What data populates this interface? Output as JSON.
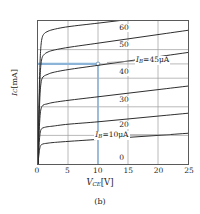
{
  "figure": {
    "caption": "(b)"
  },
  "axes": {
    "xlabel_main": "V",
    "xlabel_sub": "CE",
    "xlabel_unit": "[V]",
    "ylabel_main": "I",
    "ylabel_sub": "C",
    "ylabel_unit": "[mA]",
    "xticks": [
      "0",
      "5",
      "10",
      "15",
      "20",
      "25"
    ],
    "yticks": [
      "0",
      "2",
      "4",
      "6",
      "7",
      "8",
      "10"
    ]
  },
  "annotations": {
    "ib45_main": "I",
    "ib45_sub": "B",
    "ib45_rest": "=45μA",
    "ib10_main": "I",
    "ib10_sub": "B",
    "ib10_rest": "=10μA",
    "marker_x": "10",
    "marker_y": "7"
  },
  "colors": {
    "curve": "#2b2b2b",
    "grid": "#9a9a9a",
    "frame": "#5a5a5a",
    "annotation_blue": "#8cb4d8",
    "background": "#ffffff"
  },
  "curve_labels": [
    {
      "text": "60"
    },
    {
      "text": "50"
    },
    {
      "text": "40"
    },
    {
      "text": "30"
    },
    {
      "text": "20"
    },
    {
      "text": "0"
    }
  ],
  "chart_data": {
    "type": "line",
    "title": "",
    "subtitle": "",
    "caption": "(b)",
    "xlabel": "V_CE[V]",
    "ylabel": "I_C[mA]",
    "xlim": [
      0,
      25
    ],
    "ylim": [
      0,
      10
    ],
    "xticks": [
      0,
      5,
      10,
      15,
      20,
      25
    ],
    "yticks": [
      0,
      2,
      4,
      6,
      7,
      8,
      10
    ],
    "grid": true,
    "legend": "inline-curve-labels",
    "series": [
      {
        "name": "60",
        "ib_uA": 60,
        "label": "60",
        "label_at": {
          "x": 14.2,
          "y": 9.55
        },
        "x": [
          0,
          0.1,
          0.2,
          0.35,
          0.5,
          0.7,
          1.0,
          1.5,
          2.5,
          5,
          10,
          15,
          20,
          25
        ],
        "y": [
          0,
          2.6,
          5.0,
          7.2,
          8.3,
          8.85,
          9.1,
          9.25,
          9.4,
          9.6,
          9.85,
          10.1,
          10.35,
          10.6
        ]
      },
      {
        "name": "50",
        "ib_uA": 50,
        "label": "50",
        "label_at": {
          "x": 14.2,
          "y": 8.35
        },
        "x": [
          0,
          0.1,
          0.2,
          0.35,
          0.5,
          0.7,
          1.0,
          1.5,
          2.5,
          5,
          10,
          15,
          20,
          25
        ],
        "y": [
          0,
          2.2,
          4.3,
          6.1,
          7.0,
          7.45,
          7.65,
          7.8,
          7.95,
          8.15,
          8.45,
          8.75,
          9.05,
          9.35
        ]
      },
      {
        "name": "40",
        "ib_uA": 40,
        "label": "40",
        "label_at": {
          "x": 14.2,
          "y": 6.45
        },
        "x": [
          0,
          0.1,
          0.2,
          0.35,
          0.5,
          0.7,
          1.0,
          1.5,
          2.5,
          5,
          10,
          15,
          20,
          25
        ],
        "y": [
          0,
          1.75,
          3.45,
          4.95,
          5.65,
          6.0,
          6.15,
          6.25,
          6.4,
          6.6,
          6.9,
          7.2,
          7.5,
          7.8
        ]
      },
      {
        "name": "30",
        "ib_uA": 30,
        "label": "30",
        "label_at": {
          "x": 14.2,
          "y": 4.55
        },
        "x": [
          0,
          0.1,
          0.2,
          0.35,
          0.5,
          0.7,
          1.0,
          1.5,
          2.5,
          5,
          10,
          15,
          20,
          25
        ],
        "y": [
          0,
          1.2,
          2.35,
          3.4,
          3.85,
          4.05,
          4.15,
          4.2,
          4.3,
          4.45,
          4.7,
          4.95,
          5.2,
          5.45
        ]
      },
      {
        "name": "20",
        "ib_uA": 20,
        "label": "20",
        "label_at": {
          "x": 14.2,
          "y": 2.85
        },
        "x": [
          0,
          0.1,
          0.2,
          0.35,
          0.5,
          0.7,
          1.0,
          1.5,
          2.5,
          5,
          10,
          15,
          20,
          25
        ],
        "y": [
          0,
          0.75,
          1.5,
          2.15,
          2.4,
          2.5,
          2.55,
          2.6,
          2.65,
          2.78,
          2.95,
          3.15,
          3.35,
          3.55
        ]
      },
      {
        "name": "0",
        "ib_uA": 0,
        "label": "0",
        "label_at": {
          "x": 14.2,
          "y": 0.55
        },
        "x": [
          0,
          0.1,
          0.2,
          0.35,
          0.5,
          0.7,
          1.0,
          1.5,
          2.5,
          5,
          10,
          15,
          20,
          25
        ],
        "y": [
          0,
          0.45,
          0.85,
          1.2,
          1.32,
          1.38,
          1.42,
          1.45,
          1.5,
          1.58,
          1.72,
          1.86,
          2.0,
          2.15
        ]
      }
    ],
    "annotations": [
      {
        "type": "text-with-leader",
        "text": "I_B=45μA",
        "text_at": {
          "x": 16.3,
          "y": 7.25
        },
        "leader_from": {
          "x": 16.0,
          "y": 7.2
        },
        "leader_to": {
          "x": 11.5,
          "y": 7.1
        }
      },
      {
        "type": "text-with-leader",
        "text": "I_B=10μA",
        "text_at": {
          "x": 9.6,
          "y": 2.05
        },
        "leader_from": {
          "x": 14.3,
          "y": 2.05
        },
        "leader_to": {
          "x": 22.0,
          "y": 2.05
        }
      },
      {
        "type": "operating-point",
        "color": "#8cb4d8",
        "marker": {
          "x": 10,
          "y": 7
        },
        "hline": {
          "from_x": 0,
          "to_x": 10,
          "y": 7
        },
        "vline": {
          "x": 10,
          "from_y": 0,
          "to_y": 7
        }
      }
    ]
  }
}
